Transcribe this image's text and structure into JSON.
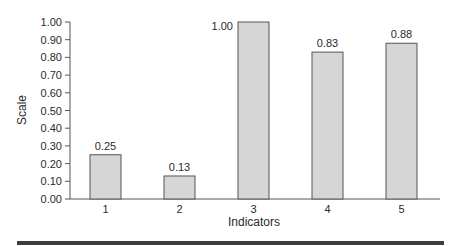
{
  "chart_data": {
    "type": "bar",
    "title": "",
    "xlabel": "Indicators",
    "ylabel": "Scale",
    "categories": [
      "1",
      "2",
      "3",
      "4",
      "5"
    ],
    "values": [
      0.25,
      0.13,
      1.0,
      0.83,
      0.88
    ],
    "value_labels": [
      "0.25",
      "0.13",
      "1.00",
      "0.83",
      "0.88"
    ],
    "ylim": [
      0,
      1.0
    ],
    "yticks": [
      "0.00",
      "0.10",
      "0.20",
      "0.30",
      "0.40",
      "0.50",
      "0.60",
      "0.70",
      "0.80",
      "0.90",
      "1.00"
    ],
    "grid": false,
    "legend": null,
    "colors": {
      "bar_fill": "#d6d6d6",
      "bar_stroke": "#555555",
      "axis": "#555555",
      "text": "#2a2a2a"
    }
  }
}
